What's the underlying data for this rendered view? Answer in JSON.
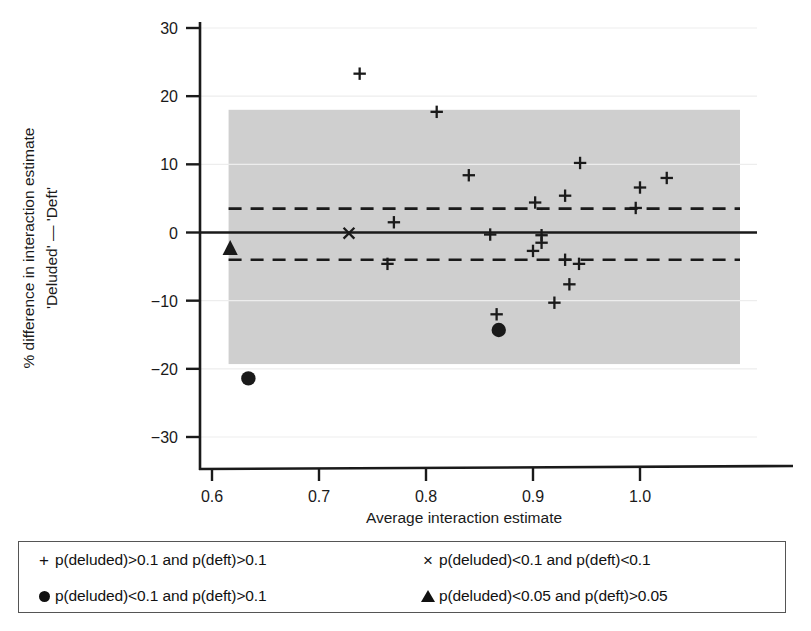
{
  "figure": {
    "background": "#ffffff",
    "band_color": "#cfcfcf",
    "line_color": "#1a1a1a"
  },
  "axes": {
    "x": {
      "label": "Average interaction estimate",
      "ticks": [
        "0.6",
        "0.7",
        "0.8",
        "0.9",
        "1.0"
      ],
      "tick_values": [
        0.6,
        0.7,
        0.8,
        0.9,
        1.0
      ],
      "range": [
        0.565,
        1.045
      ]
    },
    "y": {
      "label_line1": "% difference in interaction estimate",
      "label_line2": "'Deluded' — 'Deft'",
      "ticks": [
        "30",
        "20",
        "10",
        "0",
        "−10",
        "−20",
        "−30"
      ],
      "tick_values": [
        30,
        20,
        10,
        0,
        -10,
        -20,
        -30
      ],
      "range": [
        -34,
        33
      ]
    }
  },
  "reference_lines": {
    "mean_difference": 0,
    "upper_limit_of_agreement": 3.5,
    "lower_limit_of_agreement": -4.0,
    "shaded_band": {
      "y_top": 18.0,
      "y_bottom": -19.3,
      "x_left": 0.6155,
      "x_right": 1.0,
      "label": "shaded-agreement-region"
    }
  },
  "legend": {
    "items": [
      {
        "marker": "plus",
        "glyph": "+",
        "label": "p(deluded)>0.1 and p(deft)>0.1"
      },
      {
        "marker": "cross",
        "glyph": "×",
        "label": "p(deluded)<0.1 and p(deft)<0.1"
      },
      {
        "marker": "circle",
        "glyph": "●",
        "label": "p(deluded)<0.1 and p(deft)>0.1"
      },
      {
        "marker": "triangle",
        "glyph": "▲",
        "label": "p(deluded)<0.05 and p(deft)>0.05"
      }
    ]
  },
  "chart_data": {
    "type": "scatter",
    "title": "",
    "xlabel": "Average interaction estimate",
    "ylabel": "% difference in interaction estimate 'Deluded' — 'Deft'",
    "xlim": [
      0.565,
      1.045
    ],
    "ylim": [
      -34,
      33
    ],
    "grid": false,
    "legend_position": "below-plot",
    "series": [
      {
        "name": "p(deluded)>0.1 and p(deft)>0.1",
        "marker": "plus",
        "points": [
          {
            "x": 0.738,
            "y": 23.3
          },
          {
            "x": 0.81,
            "y": 17.7
          },
          {
            "x": 0.84,
            "y": 8.4
          },
          {
            "x": 0.902,
            "y": 4.4
          },
          {
            "x": 0.93,
            "y": 5.4
          },
          {
            "x": 0.944,
            "y": 10.2
          },
          {
            "x": 0.996,
            "y": 3.6
          },
          {
            "x": 1.0,
            "y": 6.6
          },
          {
            "x": 1.025,
            "y": 8.0
          },
          {
            "x": 0.77,
            "y": 1.5
          },
          {
            "x": 0.86,
            "y": -0.3
          },
          {
            "x": 0.908,
            "y": -0.4
          },
          {
            "x": 0.908,
            "y": -1.5
          },
          {
            "x": 0.9,
            "y": -2.7
          },
          {
            "x": 0.93,
            "y": -4.0
          },
          {
            "x": 0.943,
            "y": -4.6
          },
          {
            "x": 0.934,
            "y": -7.6
          },
          {
            "x": 0.92,
            "y": -10.3
          },
          {
            "x": 0.866,
            "y": -12.0
          },
          {
            "x": 0.764,
            "y": -4.6
          }
        ]
      },
      {
        "name": "p(deluded)<0.1 and p(deft)<0.1",
        "marker": "cross",
        "points": [
          {
            "x": 0.728,
            "y": -0.1
          }
        ]
      },
      {
        "name": "p(deluded)<0.1 and p(deft)>0.1",
        "marker": "circle",
        "points": [
          {
            "x": 0.634,
            "y": -21.4
          },
          {
            "x": 0.868,
            "y": -14.3
          }
        ]
      },
      {
        "name": "p(deluded)<0.05 and p(deft)>0.05",
        "marker": "triangle",
        "points": [
          {
            "x": 0.617,
            "y": -2.2
          }
        ]
      }
    ]
  }
}
